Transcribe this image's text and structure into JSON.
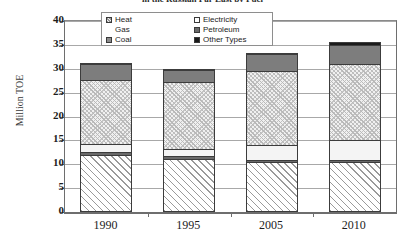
{
  "chart_data": {
    "type": "bar",
    "title": "in the Russian Far East by Fuel",
    "xlabel": "",
    "ylabel": "Million TOE",
    "categories": [
      "1990",
      "1995",
      "2005",
      "2010"
    ],
    "ylim": [
      0,
      40
    ],
    "ytick_labels": [
      "0",
      "5",
      "10",
      "15",
      "20",
      "25",
      "30",
      "35",
      "40"
    ],
    "ytick_values": [
      0,
      5,
      10,
      15,
      20,
      25,
      30,
      35,
      40
    ],
    "grid": true,
    "stacked": true,
    "legend_position": "top-center",
    "series": [
      {
        "name": "Electricity",
        "values": [
          12.0,
          11.2,
          10.5,
          10.5
        ],
        "color": "#ffffff",
        "pattern": "diagonal-hatch"
      },
      {
        "name": "Petroleum",
        "values": [
          0.6,
          0.5,
          0.5,
          0.5
        ],
        "color": "#6a6a6a",
        "pattern": "solid"
      },
      {
        "name": "Gas",
        "values": [
          1.6,
          1.5,
          3.0,
          4.0
        ],
        "color": "#f4f4f4",
        "pattern": "solid-light"
      },
      {
        "name": "Heat",
        "values": [
          13.5,
          14.0,
          15.5,
          16.0
        ],
        "color": "#f0f0f0",
        "pattern": "dotted-texture"
      },
      {
        "name": "Coal",
        "values": [
          3.3,
          2.5,
          3.5,
          4.0
        ],
        "color": "#7d7d7d",
        "pattern": "solid-grey"
      },
      {
        "name": "Other Types",
        "values": [
          0.3,
          0.3,
          0.3,
          0.6
        ],
        "color": "#1a1a1a",
        "pattern": "solid-black"
      }
    ],
    "totals": [
      31.3,
      30.0,
      33.3,
      35.6
    ]
  },
  "legend": {
    "entries": [
      {
        "label": "Heat",
        "swatch": "heat-swatch"
      },
      {
        "label": "Electricity",
        "swatch": "electricity-swatch"
      },
      {
        "label": "Gas",
        "swatch": "gas-swatch"
      },
      {
        "label": "Petroleum",
        "swatch": "petroleum-swatch"
      },
      {
        "label": "Coal",
        "swatch": "coal-swatch"
      },
      {
        "label": "Other Types",
        "swatch": "other-types-swatch"
      }
    ]
  }
}
